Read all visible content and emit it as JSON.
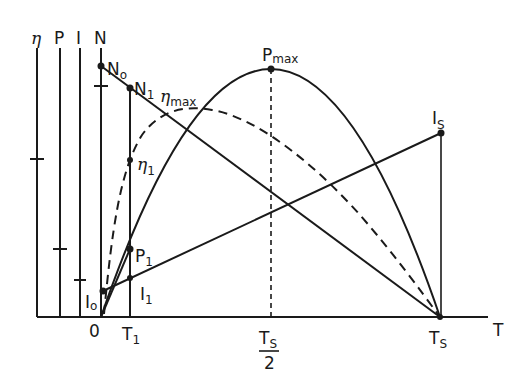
{
  "diagram": {
    "x_axis": {
      "label": "T",
      "ticks": {
        "origin": "0",
        "t1_main": "T",
        "t1_sub": "1",
        "half_num_main": "T",
        "half_num_sub": "S",
        "half_den": "2",
        "ts_main": "T",
        "ts_sub": "S"
      }
    },
    "y_axes": [
      {
        "label": "η"
      },
      {
        "label": "P"
      },
      {
        "label": "I"
      },
      {
        "label": "N"
      }
    ],
    "points": {
      "n0": {
        "main": "N",
        "sub": "o"
      },
      "n1": {
        "main": "N",
        "sub": "1"
      },
      "eta_max": {
        "main": "η",
        "sub": "max"
      },
      "eta1": {
        "main": "η",
        "sub": "1"
      },
      "pmax": {
        "main": "P",
        "sub": "max"
      },
      "p1": {
        "main": "P",
        "sub": "1"
      },
      "i0": {
        "main": "I",
        "sub": "o"
      },
      "i1": {
        "main": "I",
        "sub": "1"
      },
      "is": {
        "main": "I",
        "sub": "S"
      }
    },
    "curves": {
      "speed": "N (straight line, N0 to Ts)",
      "current": "I (straight line, I0 to Is)",
      "power": "P (parabola, peak Pmax at Ts/2)",
      "efficiency": "η (dashed curve, peak ηmax)"
    },
    "colors": {
      "ink": "#1a1a1a",
      "background": "#ffffff"
    }
  }
}
